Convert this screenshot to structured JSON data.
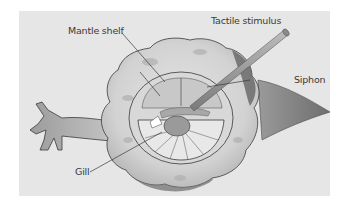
{
  "figure": {
    "colors": {
      "background": "#ffffff",
      "panel": "#e6e6e6",
      "body_light": "#dcdcdc",
      "body_shadow": "#8e8e8e",
      "outline": "#3a3a3a",
      "label_text": "#3a3a3a"
    },
    "labels": [
      {
        "id": "mantle-shelf",
        "text": "Mantle shelf"
      },
      {
        "id": "tactile-stimulus",
        "text": "Tactile stimulus"
      },
      {
        "id": "siphon",
        "text": "Siphon"
      },
      {
        "id": "gill",
        "text": "Gill"
      }
    ]
  }
}
